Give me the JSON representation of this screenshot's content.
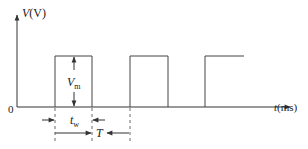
{
  "diagram": {
    "y_axis": {
      "label_var": "V",
      "label_unit": "(V)"
    },
    "x_axis": {
      "label_var": "t",
      "label_unit": "(ms)"
    },
    "origin_label": "0",
    "amplitude_label": {
      "main": "V",
      "sub": "m"
    },
    "pulse_width_label": {
      "main": "t",
      "sub": "w"
    },
    "period_label": "T",
    "pulses": [
      {
        "start_x": 55,
        "end_x": 92
      },
      {
        "start_x": 130,
        "end_x": 168
      },
      {
        "start_x": 205,
        "end_x": 244,
        "open_right": true
      }
    ],
    "colors": {
      "line": "#333333",
      "text": "#222222"
    }
  }
}
